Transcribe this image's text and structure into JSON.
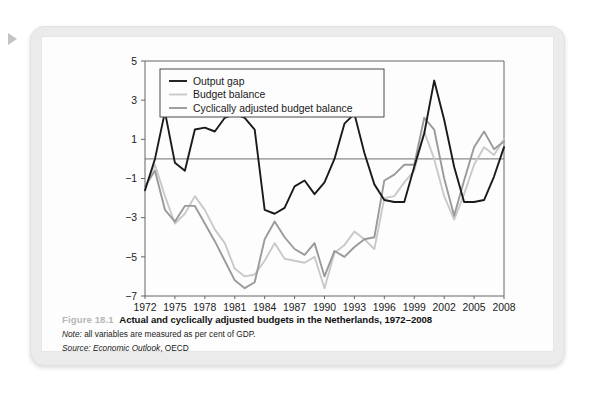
{
  "page": {
    "marker_icon": "play-triangle-icon"
  },
  "figure": {
    "number": "Figure 18.1",
    "title": "Actual and cyclically adjusted budgets in the Netherlands, 1972–2008",
    "note_label": "Note:",
    "note_text": " all variables are measured as per cent of GDP.",
    "source_label": "Source:",
    "source_italic": " Economic Outlook",
    "source_rest": ", OECD"
  },
  "colors": {
    "output_gap": "#1a1a1a",
    "budget_balance": "#c9c9c9",
    "cyclically_adjusted": "#9a9a9a",
    "axis": "#666666",
    "zero_line": "#6e6e6e",
    "card_bg": "#ebebeb",
    "panel_bg": "#fdfdfd",
    "fig_number": "#b7b7b7"
  },
  "chart_data": {
    "type": "line",
    "title": "Actual and cyclically adjusted budgets in the Netherlands, 1972–2008",
    "xlabel": "",
    "ylabel": "",
    "ylim": [
      -7,
      5
    ],
    "yticks": [
      5,
      3,
      1,
      -1,
      -3,
      -5,
      -7
    ],
    "ytick_labels": [
      "5",
      "3",
      "1",
      "−1",
      "−3",
      "−5",
      "−7"
    ],
    "xlim": [
      1972,
      2008
    ],
    "xticks": [
      1972,
      1975,
      1978,
      1981,
      1984,
      1987,
      1990,
      1993,
      1996,
      1999,
      2002,
      2005,
      2008
    ],
    "xtick_labels": [
      "1972",
      "1975",
      "1978",
      "1981",
      "1984",
      "1987",
      "1990",
      "1993",
      "1996",
      "1999",
      "2002",
      "2005",
      "2008"
    ],
    "grid": false,
    "zero_line": true,
    "legend_position": "top-left",
    "x": [
      1972,
      1973,
      1974,
      1975,
      1976,
      1977,
      1978,
      1979,
      1980,
      1981,
      1982,
      1983,
      1984,
      1985,
      1986,
      1987,
      1988,
      1989,
      1990,
      1991,
      1992,
      1993,
      1994,
      1995,
      1996,
      1997,
      1998,
      1999,
      2000,
      2001,
      2002,
      2003,
      2004,
      2005,
      2006,
      2007,
      2008
    ],
    "series": [
      {
        "name": "Output gap",
        "color": "#1a1a1a",
        "width": 1.9,
        "values": [
          -1.6,
          0.0,
          2.4,
          -0.2,
          -0.6,
          1.5,
          1.6,
          1.4,
          2.1,
          2.3,
          2.1,
          1.5,
          -2.6,
          -2.8,
          -2.5,
          -1.4,
          -1.1,
          -1.8,
          -1.2,
          0.0,
          1.8,
          2.3,
          0.3,
          -1.3,
          -2.1,
          -2.2,
          -2.2,
          -0.4,
          1.3,
          4.0,
          2.0,
          -0.4,
          -2.2,
          -2.2,
          -2.1,
          -0.9,
          0.6
        ]
      },
      {
        "name": "Budget balance",
        "color": "#c9c9c9",
        "width": 1.9,
        "values": [
          -1.5,
          -0.3,
          -1.9,
          -3.3,
          -2.8,
          -1.9,
          -2.6,
          -3.6,
          -4.3,
          -5.6,
          -6.0,
          -5.9,
          -5.2,
          -4.3,
          -5.1,
          -5.2,
          -5.3,
          -5.0,
          -6.6,
          -4.8,
          -4.4,
          -3.7,
          -4.1,
          -4.6,
          -2.0,
          -1.9,
          -1.2,
          -0.6,
          1.4,
          0.0,
          -1.9,
          -3.1,
          -1.8,
          -0.3,
          0.6,
          0.2,
          1.0
        ]
      },
      {
        "name": "Cyclically adjusted budget balance",
        "color": "#9a9a9a",
        "width": 1.9,
        "values": [
          -1.4,
          -0.6,
          -2.6,
          -3.2,
          -2.4,
          -2.4,
          -3.3,
          -4.2,
          -5.2,
          -6.2,
          -6.6,
          -6.3,
          -4.1,
          -3.2,
          -4.0,
          -4.6,
          -4.9,
          -4.3,
          -6.0,
          -4.7,
          -5.0,
          -4.5,
          -4.1,
          -4.0,
          -1.1,
          -0.8,
          -0.3,
          -0.3,
          2.1,
          1.5,
          -1.0,
          -2.9,
          -1.1,
          0.6,
          1.4,
          0.5,
          0.9
        ]
      }
    ]
  }
}
